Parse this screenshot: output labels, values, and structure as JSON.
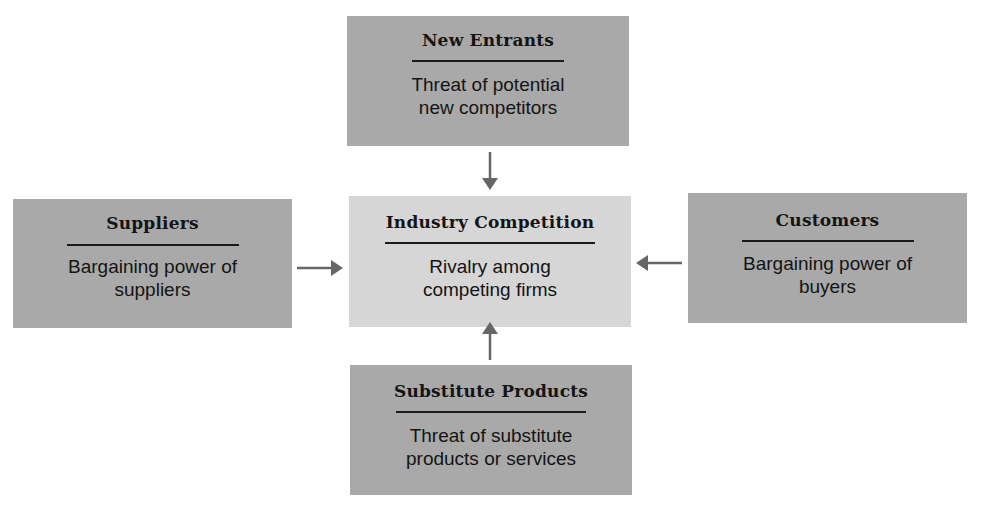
{
  "diagram": {
    "type": "five-forces",
    "colors": {
      "outer_box": "#a9a9a9",
      "center_box": "#d6d6d6",
      "arrow": "#666666",
      "text": "#141414"
    },
    "nodes": {
      "top": {
        "title": "New Entrants",
        "line1": "Threat of potential",
        "line2": "new competitors"
      },
      "left": {
        "title": "Suppliers",
        "line1": "Bargaining power of",
        "line2": "suppliers"
      },
      "center": {
        "title": "Industry Competition",
        "line1": "Rivalry among",
        "line2": "competing firms"
      },
      "right": {
        "title": "Customers",
        "line1": "Bargaining power of",
        "line2": "buyers"
      },
      "bottom": {
        "title": "Substitute Products",
        "line1": "Threat of substitute",
        "line2": "products or services"
      }
    },
    "edges": [
      {
        "from": "top",
        "to": "center"
      },
      {
        "from": "left",
        "to": "center"
      },
      {
        "from": "right",
        "to": "center"
      },
      {
        "from": "bottom",
        "to": "center"
      }
    ]
  }
}
